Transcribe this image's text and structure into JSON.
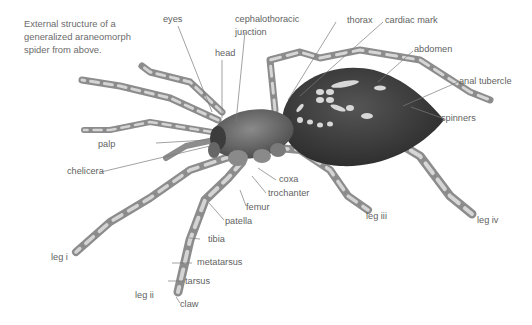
{
  "caption": "External structure of a generalized araneomorph spider from above.",
  "labels": {
    "eyes": "eyes",
    "cephalothoracic_junction_line1": "cephalothoracic",
    "cephalothoracic_junction_line2": "junction",
    "head": "head",
    "thorax": "thorax",
    "cardiac_mark": "cardiac mark",
    "abdomen": "abdomen",
    "anal_tubercle": "anal tubercle",
    "spinners": "spinners",
    "palp": "palp",
    "chelicera": "chelicera",
    "coxa": "coxa",
    "trochanter": "trochanter",
    "femur": "femur",
    "patella": "patella",
    "tibia": "tibia",
    "metatarsus": "metatarsus",
    "tarsus": "tarsus",
    "claw": "claw",
    "leg_i": "leg i",
    "leg_ii": "leg ii",
    "leg_iii": "leg iii",
    "leg_iv": "leg iv"
  },
  "colors": {
    "background": "#ffffff",
    "label_text": "#5f5f5f",
    "leader_line": "#777777",
    "body_dark": "#3a3a3a",
    "leg_light": "#b8b8b8"
  }
}
